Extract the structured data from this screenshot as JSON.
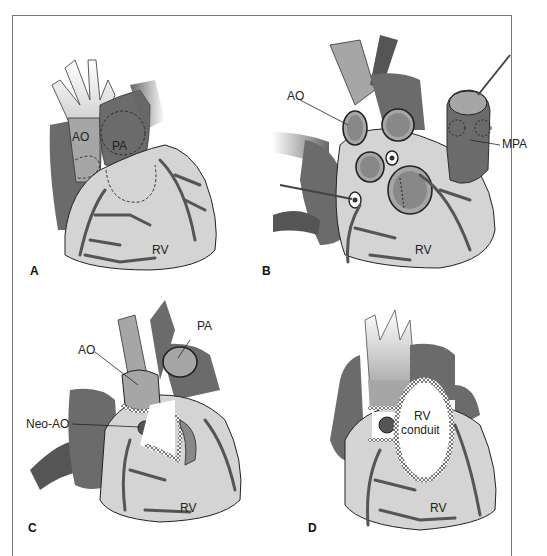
{
  "figure": {
    "panels": [
      {
        "id": "A",
        "label": "A",
        "annotations": [
          "AO",
          "PA",
          "RV"
        ]
      },
      {
        "id": "B",
        "label": "B",
        "annotations": [
          "AO",
          "MPA",
          "RV"
        ]
      },
      {
        "id": "C",
        "label": "C",
        "annotations": [
          "PA",
          "AO",
          "Neo-AO",
          "RV"
        ]
      },
      {
        "id": "D",
        "label": "D",
        "annotations": [
          "RV",
          "conduit",
          "RV"
        ]
      }
    ]
  },
  "colors": {
    "heart_light": "#d4d4d4",
    "heart_mid": "#a6a6a6",
    "heart_dark": "#6b6b6b",
    "vessel": "#555555",
    "outline": "#222222",
    "frame": "#777777"
  }
}
